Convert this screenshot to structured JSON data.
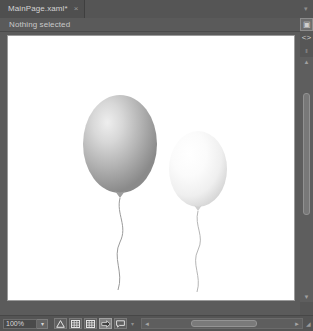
{
  "window": {
    "background_color": "#5b5b5b"
  },
  "tabstrip": {
    "tabs": [
      {
        "label": "MainPage.xaml*",
        "close_glyph": "×",
        "name": "tab-mainpage-xaml"
      }
    ],
    "menu_glyph": "▾"
  },
  "selection_bar": {
    "status_text": "Nothing selected"
  },
  "right_rail": {
    "buttons": [
      {
        "name": "design-view-icon",
        "glyph": "▣",
        "boxed": true
      },
      {
        "name": "xaml-code-view-icon",
        "glyph": "<>",
        "boxed": false
      },
      {
        "name": "split-view-icon",
        "glyph": "‖",
        "boxed": false
      },
      {
        "name": "rail-overflow-icon",
        "glyph": "▾",
        "boxed": false
      }
    ]
  },
  "vertical_scrollbar": {
    "up_glyph": "▲",
    "down_glyph": "▼"
  },
  "statusbar": {
    "zoom": {
      "value": "100%",
      "dropdown_glyph": "▾"
    },
    "tools": [
      {
        "name": "snap-to-gridlines-button",
        "icon": "snap-triangle-icon",
        "active": false
      },
      {
        "name": "show-grid-button",
        "icon": "grid-icon",
        "active": false
      },
      {
        "name": "snap-to-grid-button",
        "icon": "grid-snap-icon",
        "active": false
      },
      {
        "name": "snap-to-alignment-button",
        "icon": "arrow-snap-icon",
        "active": true
      },
      {
        "name": "annotations-button",
        "icon": "speech-bubble-icon",
        "active": false
      }
    ],
    "overflow_glyph": "▾",
    "scrollbar": {
      "left_glyph": "◄",
      "right_glyph": "►"
    },
    "end_glyph": "◢"
  },
  "artboard": {
    "background_color": "#ffffff",
    "border_color": "#9b9b9b",
    "objects": [
      {
        "name": "balloon-gray",
        "type": "balloon",
        "cx": 112,
        "cy": 108,
        "rx": 37,
        "ry": 49,
        "fill_center": "#e9e9e9",
        "fill_edge": "#8d8d8d",
        "highlight_x": "33%",
        "highlight_y": "28%",
        "string_color": "#9a9a9a"
      },
      {
        "name": "balloon-white",
        "type": "balloon",
        "cx": 190,
        "cy": 133,
        "rx": 29,
        "ry": 38,
        "fill_center": "#ffffff",
        "fill_edge": "#dadada",
        "highlight_x": "35%",
        "highlight_y": "30%",
        "string_color": "#b5b5b5"
      }
    ]
  }
}
